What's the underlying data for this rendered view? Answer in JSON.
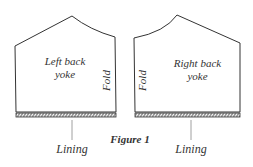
{
  "figure": {
    "caption": "Figure 1",
    "pieces": [
      {
        "name": "Left back yoke",
        "line1": "Left back",
        "line2": "yoke",
        "fold_label": "Fold",
        "lining_label": "Lining"
      },
      {
        "name": "Right back yoke",
        "line1": "Right back",
        "line2": "yoke",
        "fold_label": "Fold",
        "lining_label": "Lining"
      }
    ]
  },
  "colors": {
    "stroke": "#333333",
    "background": "#ffffff"
  }
}
